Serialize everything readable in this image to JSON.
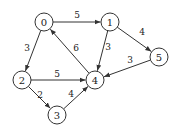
{
  "diagram": {
    "type": "directed-weighted-graph",
    "node_radius": 9,
    "colors": {
      "stroke": "#333333",
      "fill": "#ffffff",
      "text": "#222222"
    },
    "nodes": [
      {
        "id": "0",
        "label": "0",
        "x": 44,
        "y": 22
      },
      {
        "id": "1",
        "label": "1",
        "x": 110,
        "y": 22
      },
      {
        "id": "2",
        "label": "2",
        "x": 22,
        "y": 80
      },
      {
        "id": "3",
        "label": "3",
        "x": 57,
        "y": 115
      },
      {
        "id": "4",
        "label": "4",
        "x": 95,
        "y": 80
      },
      {
        "id": "5",
        "label": "5",
        "x": 159,
        "y": 57
      }
    ],
    "edges": [
      {
        "from": "0",
        "to": "1",
        "weight": "5",
        "lx": 77,
        "ly": 15
      },
      {
        "from": "0",
        "to": "2",
        "weight": "3",
        "lx": 27,
        "ly": 48
      },
      {
        "from": "4",
        "to": "0",
        "weight": "6",
        "lx": 76,
        "ly": 48
      },
      {
        "from": "1",
        "to": "4",
        "weight": "3",
        "lx": 108,
        "ly": 47
      },
      {
        "from": "1",
        "to": "5",
        "weight": "4",
        "lx": 142,
        "ly": 32
      },
      {
        "from": "5",
        "to": "4",
        "weight": "3",
        "lx": 130,
        "ly": 60
      },
      {
        "from": "2",
        "to": "4",
        "weight": "5",
        "lx": 57,
        "ly": 74
      },
      {
        "from": "2",
        "to": "3",
        "weight": "2",
        "lx": 40,
        "ly": 95
      },
      {
        "from": "3",
        "to": "4",
        "weight": "4",
        "lx": 71,
        "ly": 94
      }
    ]
  }
}
